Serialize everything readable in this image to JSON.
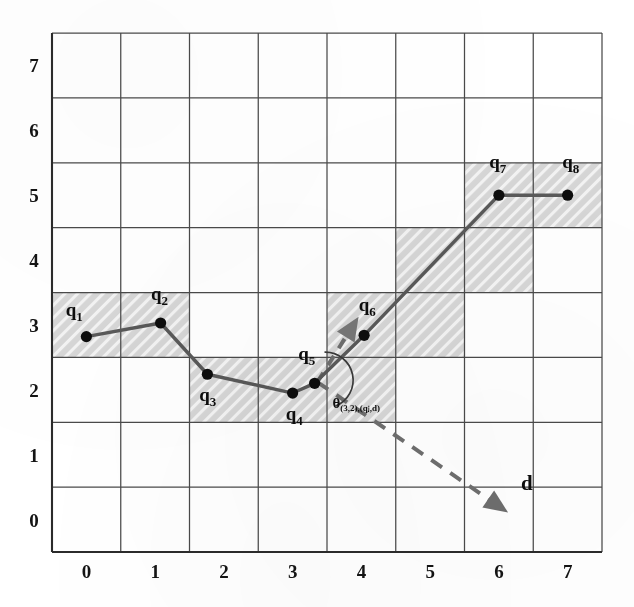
{
  "figure": {
    "kind": "scatter-trajectory-on-grid",
    "background_color": "#ffffff",
    "grid": {
      "line_color": "#4a4a4a",
      "x_min": -0.5,
      "x_max": 7.5,
      "y_min": -0.5,
      "y_max": 7.5,
      "cell_size": 1,
      "show": true
    },
    "axes": {
      "x_ticks": [
        "0",
        "1",
        "2",
        "3",
        "4",
        "5",
        "6",
        "7"
      ],
      "y_ticks": [
        "0",
        "1",
        "2",
        "3",
        "4",
        "5",
        "6",
        "7"
      ],
      "xlabel": "",
      "ylabel": "",
      "axis_line_color": "#2b2b2b"
    },
    "shaded_cells": {
      "fill_color": "#d5d5d5",
      "hatch": "diagonal",
      "hatch_color": "#ffffff",
      "cells": [
        {
          "x": 0,
          "y": 3
        },
        {
          "x": 1,
          "y": 3
        },
        {
          "x": 2,
          "y": 2
        },
        {
          "x": 3,
          "y": 2
        },
        {
          "x": 4,
          "y": 2
        },
        {
          "x": 4,
          "y": 3
        },
        {
          "x": 5,
          "y": 3
        },
        {
          "x": 5,
          "y": 4
        },
        {
          "x": 6,
          "y": 4
        },
        {
          "x": 6,
          "y": 5
        },
        {
          "x": 7,
          "y": 5
        }
      ]
    },
    "trajectory": {
      "name": "q",
      "line_color": "#595959",
      "marker_color": "#0d0d0d",
      "marker_shape": "circle",
      "points": [
        {
          "label": "q",
          "sub": "1",
          "x": 0.0,
          "y": 2.82,
          "lx": -0.3,
          "ly": 3.14
        },
        {
          "label": "q",
          "sub": "2",
          "x": 1.08,
          "y": 3.03,
          "lx": 0.94,
          "ly": 3.38
        },
        {
          "label": "q",
          "sub": "3",
          "x": 1.76,
          "y": 2.24,
          "lx": 1.64,
          "ly": 1.82
        },
        {
          "label": "q",
          "sub": "4",
          "x": 3.0,
          "y": 1.95,
          "lx": 2.9,
          "ly": 1.54
        },
        {
          "label": "q",
          "sub": "5",
          "x": 3.32,
          "y": 2.1,
          "lx": 3.08,
          "ly": 2.46
        },
        {
          "label": "q",
          "sub": "6",
          "x": 4.04,
          "y": 2.84,
          "lx": 3.96,
          "ly": 3.22
        },
        {
          "label": "q",
          "sub": "7",
          "x": 6.0,
          "y": 5.0,
          "lx": 5.86,
          "ly": 5.42
        },
        {
          "label": "q",
          "sub": "8",
          "x": 7.0,
          "y": 5.0,
          "lx": 6.92,
          "ly": 5.42
        }
      ]
    },
    "direction_vector": {
      "label": "d",
      "label_x": 6.32,
      "label_y": 0.46,
      "color": "#6e6e6e",
      "style": "dashed",
      "start": {
        "x": 3.36,
        "y": 2.12
      },
      "end": {
        "x": 5.98,
        "y": 0.22
      },
      "arrow_head": "triangle"
    },
    "heading_arrow": {
      "color": "#6e6e6e",
      "start": {
        "x": 3.36,
        "y": 2.12
      },
      "end": {
        "x": 3.86,
        "y": 2.96
      },
      "arrow_head": "triangle"
    },
    "angle_annotation": {
      "text_theta": "θ",
      "text_sub": "(3,2),(qⱼ,d)",
      "label_x": 3.58,
      "label_y": 1.72,
      "arc_color": "#3a3a3a",
      "vertex": {
        "x": 3.42,
        "y": 2.18
      }
    }
  }
}
